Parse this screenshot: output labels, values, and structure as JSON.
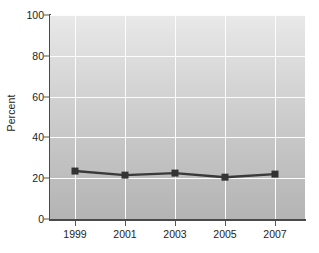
{
  "chart_data": {
    "type": "line",
    "title": "",
    "subtitle": "",
    "xlabel": "",
    "ylabel": "Percent",
    "categories": [
      "1999",
      "2001",
      "2003",
      "2005",
      "2007"
    ],
    "x": [
      1999,
      2001,
      2003,
      2005,
      2007
    ],
    "values": [
      23.5,
      21.5,
      22.5,
      20.5,
      22.0
    ],
    "series": [
      {
        "name": "Percent",
        "values": [
          23.5,
          21.5,
          22.5,
          20.5,
          22.0
        ]
      }
    ],
    "ylim": [
      0,
      100
    ],
    "y_ticks": [
      0,
      20,
      40,
      60,
      80,
      100
    ],
    "y_tick_labels": [
      "0",
      "20",
      "40",
      "60",
      "80",
      "100"
    ],
    "x_tick_labels": [
      "1999",
      "2001",
      "2003",
      "2005",
      "2007"
    ],
    "grid": true,
    "grid_color": "#fdfdfd",
    "legend": false,
    "legend_position": "none",
    "marker": "square",
    "line_color": "#3a3a3a",
    "marker_color": "#333333",
    "plot_bg_top": "#e9e9e9",
    "plot_bg_bottom": "#b4b4b4",
    "axis_color": "#4a4a4a",
    "text_color": "#1d1d1d"
  }
}
